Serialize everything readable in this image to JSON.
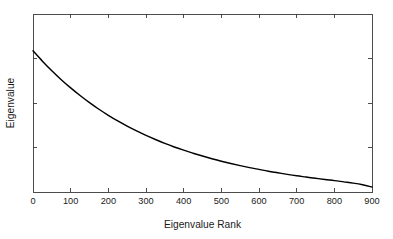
{
  "figure": {
    "background_color": "#ffffff",
    "frame_color": "#3a3a3a",
    "curve_color": "#000000",
    "text_color": "#1a1a1a"
  },
  "chart_data": {
    "type": "line",
    "title": "",
    "subtitle": "",
    "xlabel": "Eigenvalue Rank",
    "ylabel": "Eigenvalue",
    "xlim": [
      0,
      900
    ],
    "ylim": [
      0,
      1
    ],
    "grid": false,
    "legend": null,
    "legend_position": "none",
    "x_tick_labels": [
      "0",
      "100",
      "200",
      "300",
      "400",
      "500",
      "600",
      "700",
      "800",
      "900"
    ],
    "x_ticks": [
      0,
      100,
      200,
      300,
      400,
      500,
      600,
      700,
      800,
      900
    ],
    "y_tick_labels": [
      "",
      "",
      "",
      "",
      ""
    ],
    "y_ticks": [
      0,
      0.25,
      0.5,
      0.75,
      1.0
    ],
    "y_axis_labeled": false,
    "frame": "full-box",
    "tick_direction": "in",
    "series": [
      {
        "name": "eigenvalue-spectrum",
        "color": "#000000",
        "x": [
          0,
          25,
          50,
          75,
          100,
          125,
          150,
          175,
          200,
          225,
          250,
          275,
          300,
          325,
          350,
          375,
          400,
          425,
          450,
          475,
          500,
          525,
          550,
          575,
          600,
          625,
          650,
          675,
          700,
          725,
          750,
          775,
          800,
          825,
          850,
          875,
          900
        ],
        "values": [
          0.793,
          0.735,
          0.681,
          0.631,
          0.585,
          0.542,
          0.502,
          0.465,
          0.431,
          0.399,
          0.37,
          0.343,
          0.318,
          0.295,
          0.273,
          0.253,
          0.235,
          0.218,
          0.202,
          0.187,
          0.173,
          0.16,
          0.148,
          0.137,
          0.127,
          0.117,
          0.108,
          0.099,
          0.091,
          0.084,
          0.077,
          0.07,
          0.064,
          0.057,
          0.05,
          0.041,
          0.028
        ]
      }
    ],
    "annotations": []
  }
}
